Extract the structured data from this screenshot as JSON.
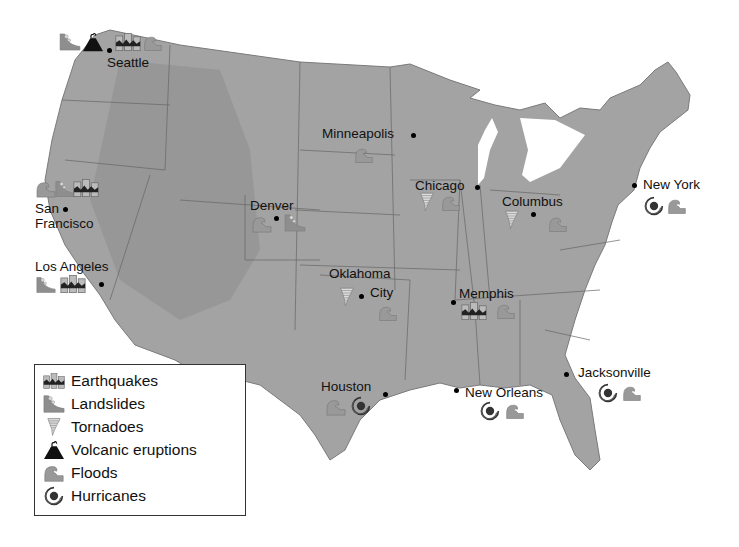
{
  "map": {
    "land_color": "#9a9a9a",
    "border_color": "#555555",
    "water_color": "#ffffff",
    "hurricane_color": "#444444"
  },
  "cities": [
    {
      "id": "seattle",
      "label": "Seattle",
      "hazards": [
        "landslides",
        "volcanic_eruptions",
        "earthquakes",
        "floods"
      ]
    },
    {
      "id": "san-francisco",
      "label_line1": "San",
      "label_line2": "Francisco",
      "hazards": [
        "floods",
        "landslides",
        "earthquakes"
      ]
    },
    {
      "id": "los-angeles",
      "label": "Los Angeles",
      "hazards": [
        "landslides",
        "earthquakes"
      ]
    },
    {
      "id": "denver",
      "label": "Denver",
      "hazards": [
        "floods",
        "landslides"
      ]
    },
    {
      "id": "minneapolis",
      "label": "Minneapolis",
      "hazards": [
        "floods"
      ]
    },
    {
      "id": "chicago",
      "label": "Chicago",
      "hazards": [
        "tornadoes",
        "floods"
      ]
    },
    {
      "id": "columbus",
      "label": "Columbus",
      "hazards": [
        "tornadoes",
        "floods"
      ]
    },
    {
      "id": "new-york",
      "label": "New York",
      "hazards": [
        "hurricanes",
        "floods"
      ]
    },
    {
      "id": "oklahoma-city",
      "label_line1": "Oklahoma",
      "label_line2": "City",
      "hazards": [
        "tornadoes",
        "floods"
      ]
    },
    {
      "id": "memphis",
      "label": "Memphis",
      "hazards": [
        "earthquakes",
        "floods"
      ]
    },
    {
      "id": "houston",
      "label": "Houston",
      "hazards": [
        "floods",
        "hurricanes"
      ]
    },
    {
      "id": "new-orleans",
      "label": "New Orleans",
      "hazards": [
        "hurricanes",
        "floods"
      ]
    },
    {
      "id": "jacksonville",
      "label": "Jacksonville",
      "hazards": [
        "hurricanes",
        "floods"
      ]
    }
  ],
  "legend": {
    "items": [
      {
        "icon": "earthquake-icon",
        "label": "Earthquakes"
      },
      {
        "icon": "landslide-icon",
        "label": "Landslides"
      },
      {
        "icon": "tornado-icon",
        "label": "Tornadoes"
      },
      {
        "icon": "volcano-icon",
        "label": "Volcanic eruptions"
      },
      {
        "icon": "flood-icon",
        "label": "Floods"
      },
      {
        "icon": "hurricane-icon",
        "label": "Hurricanes"
      }
    ]
  }
}
